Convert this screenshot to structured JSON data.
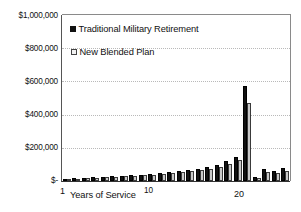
{
  "chart_data": {
    "type": "bar",
    "title": "",
    "subtitle": "",
    "xlabel": "Years of Service",
    "ylabel": "",
    "ylim": [
      0,
      1000000
    ],
    "xlim_categories": [
      "1",
      "2",
      "3",
      "4",
      "5",
      "6",
      "7",
      "8",
      "9",
      "10",
      "11",
      "12",
      "13",
      "14",
      "15",
      "16",
      "17",
      "18",
      "19",
      "20",
      "21",
      "22",
      "23",
      "24"
    ],
    "categories": [
      "1",
      "2",
      "3",
      "4",
      "5",
      "6",
      "7",
      "8",
      "9",
      "10",
      "11",
      "12",
      "13",
      "14",
      "15",
      "16",
      "17",
      "18",
      "19",
      "20",
      "21",
      "22",
      "23",
      "24"
    ],
    "grid": true,
    "grid_axis": "y",
    "legend_position": "inside-top-left",
    "y_tick_labels": [
      "$1,000,000",
      "$800,000",
      "$600,000",
      "$400,000",
      "$200,000",
      "$-"
    ],
    "y_tick_values": [
      1000000,
      800000,
      600000,
      400000,
      200000,
      0
    ],
    "x_tick_labels": [
      "1",
      "10",
      "20"
    ],
    "x_tick_values": [
      1,
      10,
      20
    ],
    "series": [
      {
        "name": "Traditional Military Retirement",
        "color": "#111111",
        "values": [
          14000,
          16000,
          19000,
          22000,
          25000,
          28000,
          31000,
          34000,
          38000,
          42000,
          47000,
          52000,
          58000,
          65000,
          73000,
          82000,
          96000,
          118000,
          145000,
          573000,
          22000,
          70000,
          62000,
          78000
        ]
      },
      {
        "name": "New Blended Plan",
        "color": "#c9c9c9",
        "values": [
          11000,
          13000,
          16000,
          19000,
          22000,
          25000,
          28000,
          31000,
          34000,
          38000,
          42000,
          47000,
          52000,
          58000,
          65000,
          73000,
          86000,
          104000,
          128000,
          470000,
          18000,
          55000,
          50000,
          62000
        ]
      }
    ]
  },
  "legend": {
    "entries": [
      {
        "label": "Traditional Military Retirement",
        "marker": "filled-square",
        "color": "#111111"
      },
      {
        "label": "New Blended Plan",
        "marker": "open-square",
        "color": "#f2f2f2"
      }
    ]
  },
  "axes": {
    "y_labels": [
      "$1,000,000",
      "$800,000",
      "$600,000",
      "$400,000",
      "$200,000",
      "$-"
    ],
    "x_title": "Years of Service",
    "x_label_start": "1",
    "x_label_mid": "10",
    "x_label_end": "20"
  }
}
